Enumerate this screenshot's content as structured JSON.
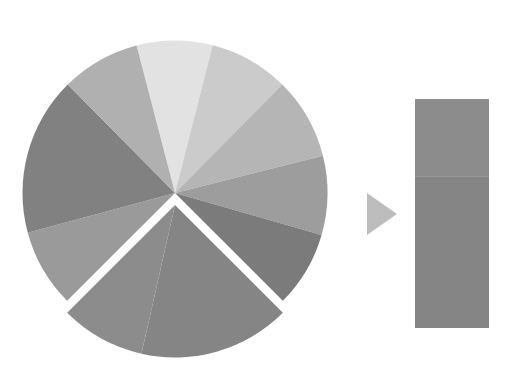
{
  "chart_data": {
    "type": "pie",
    "subtype": "pie-of-bar",
    "title": "",
    "legend": [],
    "note": "Unlabeled grayscale pie chart; two slices (90° wedge at bottom) are exploded and broken out into a stacked bar on the right, connected by a right-pointing arrow.",
    "pie": {
      "center": [
        175,
        193
      ],
      "radius": 152.5,
      "explode_offset": [
        0,
        12
      ],
      "slices": [
        {
          "id": "s1",
          "start_deg": -104.6,
          "end_deg": -75.7,
          "percent": 8.0,
          "color": "#e2e2e2",
          "exploded": false
        },
        {
          "id": "s2",
          "start_deg": -75.7,
          "end_deg": -45.3,
          "percent": 8.4,
          "color": "#cbcbcb",
          "exploded": false
        },
        {
          "id": "s3",
          "start_deg": -45.3,
          "end_deg": -14.1,
          "percent": 8.7,
          "color": "#b5b5b5",
          "exploded": false
        },
        {
          "id": "s4",
          "start_deg": -14.1,
          "end_deg": 16.0,
          "percent": 8.4,
          "color": "#9d9d9d",
          "exploded": false
        },
        {
          "id": "s5",
          "start_deg": 16.0,
          "end_deg": 45.0,
          "percent": 8.1,
          "color": "#7b7b7b",
          "exploded": false
        },
        {
          "id": "s6",
          "start_deg": 45.0,
          "end_deg": 102.7,
          "percent": 16.0,
          "color": "#858585",
          "exploded": true
        },
        {
          "id": "s7",
          "start_deg": 102.7,
          "end_deg": 135.0,
          "percent": 9.0,
          "color": "#8c8c8c",
          "exploded": true
        },
        {
          "id": "s8",
          "start_deg": 135.0,
          "end_deg": 164.9,
          "percent": 8.3,
          "color": "#9a9a9a",
          "exploded": false
        },
        {
          "id": "s9",
          "start_deg": 164.9,
          "end_deg": 225.3,
          "percent": 16.8,
          "color": "#818181",
          "exploded": false
        },
        {
          "id": "s10",
          "start_deg": 225.3,
          "end_deg": 255.4,
          "percent": 8.4,
          "color": "#b0b0b0",
          "exploded": false
        }
      ]
    },
    "arrow": {
      "points": [
        [
          367,
          193
        ],
        [
          397,
          214
        ],
        [
          367,
          235
        ]
      ],
      "color": "#bdbdbd"
    },
    "bar": {
      "x": 415,
      "y": 99,
      "width": 74,
      "height": 229,
      "segments": [
        {
          "id": "b1",
          "source_slice": "s7",
          "percent": 34,
          "color": "#8c8c8c"
        },
        {
          "id": "b2",
          "source_slice": "s6",
          "percent": 66,
          "color": "#858585"
        }
      ]
    },
    "gap_color": "#ffffff"
  }
}
